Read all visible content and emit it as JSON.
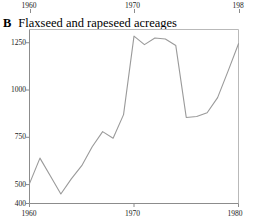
{
  "figure": {
    "panel_letter": "B",
    "title": "Flaxseed and rapeseed acreages"
  },
  "colors": {
    "line": "#9a9a9a",
    "axis": "#8c8c8c",
    "frame": "#b9b9b9",
    "text": "#1a1a1a"
  },
  "axes": {
    "top": {
      "ticks": [
        {
          "label": "1960",
          "value": 1960
        },
        {
          "label": "1970",
          "value": 1970
        },
        {
          "label": "198",
          "value": 1980
        }
      ]
    },
    "bottom": {
      "ticks": [
        {
          "label": "1960",
          "value": 1960
        },
        {
          "label": "1970",
          "value": 1970
        },
        {
          "label": "1980",
          "value": 1980
        }
      ]
    },
    "left": {
      "ticks": [
        {
          "label": "1250",
          "value": 1250
        },
        {
          "label": "1000",
          "value": 1000
        },
        {
          "label": "750",
          "value": 750
        },
        {
          "label": "500",
          "value": 500
        },
        {
          "label": "400",
          "value": 400
        }
      ]
    }
  },
  "chart_data": {
    "type": "line",
    "xlabel": "",
    "ylabel": "",
    "xlim": [
      1960,
      1980
    ],
    "ylim": [
      400,
      1320
    ],
    "grid": false,
    "legend": null,
    "x": [
      1960,
      1961,
      1962,
      1963,
      1964,
      1965,
      1966,
      1967,
      1968,
      1969,
      1970,
      1971,
      1972,
      1973,
      1974,
      1975,
      1976,
      1977,
      1978,
      1979,
      1980
    ],
    "series": [
      {
        "name": "Flaxseed and rapeseed acreages",
        "values": [
          505,
          640,
          545,
          450,
          530,
          600,
          700,
          780,
          745,
          870,
          1285,
          1240,
          1275,
          1270,
          1235,
          855,
          860,
          880,
          960,
          1100,
          1245
        ]
      }
    ]
  }
}
